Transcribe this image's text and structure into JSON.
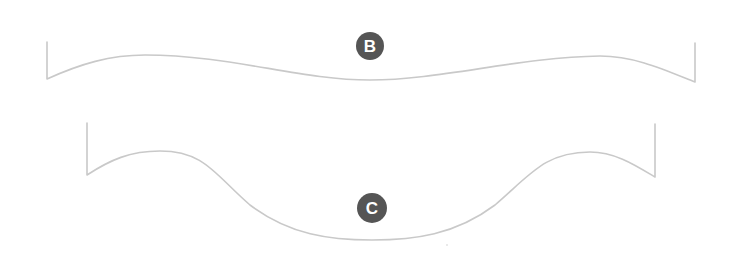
{
  "diagram": {
    "labels": {
      "b": "B",
      "c": "C"
    },
    "colors": {
      "curve": "#c9c9c9",
      "badge": "#555555",
      "badge_text": "#ffffff",
      "background": "#ffffff"
    }
  }
}
